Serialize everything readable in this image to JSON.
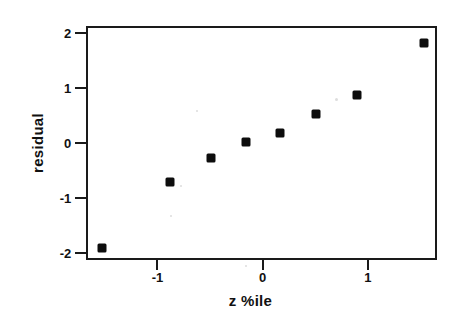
{
  "chart_data": {
    "type": "scatter",
    "title": "",
    "xlabel": "z %ile",
    "ylabel": "residual",
    "xlim": [
      -1.68,
      1.66
    ],
    "ylim": [
      -2.12,
      2.12
    ],
    "xticks": [
      -1,
      0,
      1
    ],
    "xticklabels": [
      "-1",
      "0",
      "1"
    ],
    "yticks": [
      2,
      1,
      0,
      -1,
      -2
    ],
    "yticklabels": [
      "2",
      "1",
      "0",
      "-1",
      "-2"
    ],
    "grid": false,
    "legend": null,
    "marker": "square",
    "marker_color": "#0d0d0d",
    "series": [
      {
        "name": "residuals",
        "x": [
          -1.55,
          -0.9,
          -0.51,
          -0.18,
          0.15,
          0.49,
          0.88,
          1.52
        ],
        "y": [
          -1.87,
          -0.67,
          -0.24,
          0.06,
          0.21,
          0.56,
          0.9,
          1.84
        ]
      }
    ],
    "points": [
      {
        "x": -1.55,
        "y": -1.87
      },
      {
        "x": -0.9,
        "y": -0.67
      },
      {
        "x": -0.51,
        "y": -0.24
      },
      {
        "x": -0.18,
        "y": 0.06
      },
      {
        "x": 0.15,
        "y": 0.21
      },
      {
        "x": 0.49,
        "y": 0.56
      },
      {
        "x": 0.88,
        "y": 0.9
      },
      {
        "x": 1.52,
        "y": 1.84
      }
    ]
  },
  "axes": {
    "frame_color": "#1a1a1a",
    "background": "#ffffff"
  }
}
